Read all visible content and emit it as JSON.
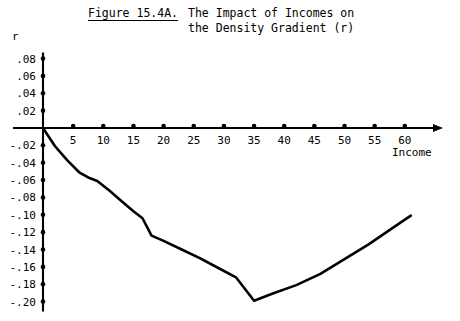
{
  "figure": {
    "number_label": "Figure 15.4A.",
    "title_line_1": "The Impact of Incomes on",
    "title_line_2": "the Density Gradient (r)"
  },
  "axes": {
    "y_axis_label": "r",
    "x_axis_label": "Income"
  },
  "chart_data": {
    "type": "line",
    "title": "Figure 15.4A.  The Impact of Incomes on the Density Gradient (r)",
    "xlabel": "Income",
    "ylabel": "r",
    "xlim": [
      0,
      62
    ],
    "ylim": [
      -0.2,
      0.08
    ],
    "grid": false,
    "legend": null,
    "x_ticks": [
      5,
      10,
      15,
      20,
      25,
      30,
      35,
      40,
      45,
      50,
      55,
      60
    ],
    "x_tick_labels": [
      "5",
      "10",
      "15",
      "20",
      "25",
      "30",
      "35",
      "40",
      "45",
      "50",
      "55",
      "60"
    ],
    "y_ticks": [
      0.08,
      0.06,
      0.04,
      0.02,
      -0.02,
      -0.04,
      -0.06,
      -0.08,
      -0.1,
      -0.12,
      -0.14,
      -0.16,
      -0.18,
      -0.2
    ],
    "y_tick_labels": [
      ".08",
      ".06",
      ".04",
      ".02",
      "-.02",
      "-.04",
      "-.06",
      "-.08",
      "-.10",
      "-.12",
      "-.14",
      "-.16",
      "-.18",
      "-.20"
    ],
    "series": [
      {
        "name": "Density gradient (r)",
        "color": "#000000",
        "x": [
          0,
          2,
          4,
          6,
          7.5,
          9,
          11,
          13,
          15,
          16.5,
          18,
          20,
          23,
          26,
          29,
          32,
          35,
          38,
          42,
          46,
          50,
          54,
          58,
          61
        ],
        "values": [
          0.0,
          -0.021,
          -0.037,
          -0.051,
          -0.057,
          -0.061,
          -0.072,
          -0.084,
          -0.096,
          -0.104,
          -0.124,
          -0.13,
          -0.14,
          -0.15,
          -0.161,
          -0.172,
          -0.199,
          -0.191,
          -0.181,
          -0.168,
          -0.151,
          -0.134,
          -0.115,
          -0.101
        ]
      }
    ],
    "minimum": {
      "x": 35,
      "y": -0.199
    }
  }
}
